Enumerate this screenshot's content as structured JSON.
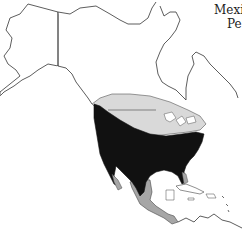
{
  "map": {
    "region": "North and Central America",
    "legend_colors": {
      "land_outline": "#333333",
      "range_year_round": "#111111",
      "range_northern_summer": "#d9d9d9",
      "range_southern_winter": "#a6a6a6",
      "background": "#ffffff"
    },
    "labels": {
      "line1": "Mexi",
      "line2": "Pe"
    }
  }
}
